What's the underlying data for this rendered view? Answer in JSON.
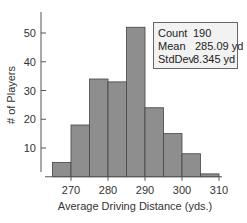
{
  "chart_data": {
    "type": "bar",
    "subtype": "histogram",
    "title": "",
    "xlabel": "Average Driving Distance (yds.)",
    "ylabel": "# of Players",
    "bin_edges": [
      265,
      270,
      275,
      280,
      285,
      290,
      295,
      300,
      305,
      310
    ],
    "values": [
      5,
      18,
      34,
      33,
      52,
      24,
      15,
      8,
      1
    ],
    "xlim": [
      265,
      310
    ],
    "ylim": [
      0,
      55
    ],
    "x_ticks": [
      270,
      280,
      290,
      300,
      310
    ],
    "y_ticks": [
      10,
      20,
      30,
      40,
      50
    ],
    "grid": false,
    "bar_color": "#8e8e8e",
    "bar_edge_color": "#444444",
    "stats_box": {
      "placement": "top-right",
      "rows": [
        {
          "label": "Count",
          "value": "190"
        },
        {
          "label": "Mean",
          "value": "285.09 yd"
        },
        {
          "label": "StdDev",
          "value": "8.345 yd"
        }
      ]
    }
  }
}
